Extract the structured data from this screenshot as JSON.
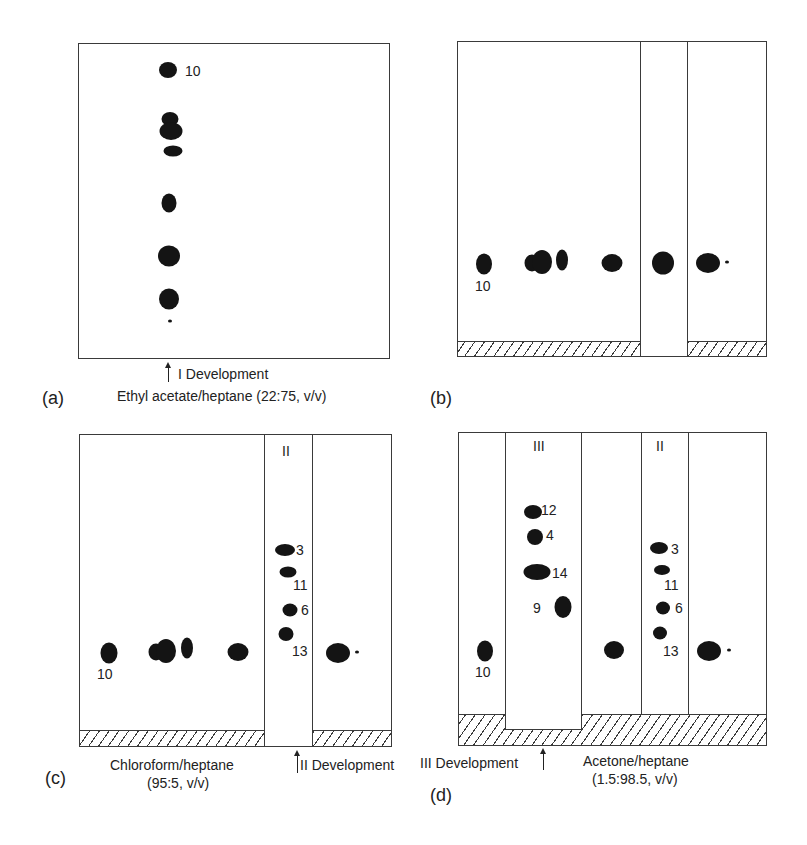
{
  "figure": {
    "panels": [
      {
        "id": "a",
        "letter": "(a)",
        "development_label": "I Development",
        "solvent_label": "Ethyl acetate/heptane (22:75, v/v)"
      },
      {
        "id": "b",
        "letter": "(b)"
      },
      {
        "id": "c",
        "letter": "(c)",
        "lane_label": "II",
        "development_label": "II Development",
        "solvent_label": "Chloroform/heptane",
        "solvent_ratio": "(95:5, v/v)"
      },
      {
        "id": "d",
        "letter": "(d)",
        "lane_labels": [
          "III",
          "II"
        ],
        "development_label": "III Development",
        "solvent_label": "Acetone/heptane",
        "solvent_ratio": "(1.5:98.5, v/v)"
      }
    ],
    "spot_labels": {
      "a": [
        "10"
      ],
      "b": [
        "10"
      ],
      "c": [
        "10",
        "3",
        "11",
        "6",
        "13"
      ],
      "d": [
        "10",
        "12",
        "4",
        "14",
        "9",
        "3",
        "11",
        "6",
        "13"
      ]
    },
    "colors": {
      "spot": "#141414",
      "line": "#3a3a3a",
      "background": "#ffffff"
    }
  }
}
